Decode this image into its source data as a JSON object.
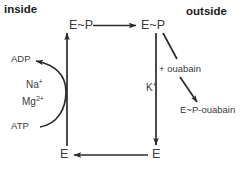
{
  "diagram": {
    "line_color": "#2b2b2b",
    "text_color": "#3a3a3a",
    "background": "#ffffff",
    "headings": {
      "inside": "inside",
      "outside": "outside"
    },
    "nodes": {
      "ep_inside": "E~P",
      "ep_outside": "E~P",
      "e_inside": "E",
      "e_outside": "E",
      "ep_ouabain": "E~P-ouabain"
    },
    "labels": {
      "adp": "ADP",
      "atp": "ATP",
      "sodium": "Na",
      "sodium_charge": "+",
      "magnesium": "Mg",
      "magnesium_charge": "2+",
      "potassium": "K",
      "potassium_charge": "+",
      "ouabain": "+ ouabain"
    },
    "edges": [
      {
        "name": "ep-inside-to-ep-outside",
        "from": "E~P (inside)",
        "to": "E~P (outside)",
        "direction": "right"
      },
      {
        "name": "ep-outside-to-e-outside",
        "from": "E~P (outside)",
        "to": "E (outside)",
        "direction": "down",
        "label": "K+"
      },
      {
        "name": "e-outside-to-e-inside",
        "from": "E (outside)",
        "to": "E (inside)",
        "direction": "left"
      },
      {
        "name": "e-inside-to-ep-inside",
        "from": "E (inside)",
        "to": "E~P (inside)",
        "direction": "up"
      },
      {
        "name": "atp-to-adp",
        "from": "ATP",
        "to": "ADP",
        "direction": "curved-up-left",
        "label": "Na+ Mg2+"
      },
      {
        "name": "ep-outside-to-ep-ouabain",
        "from": "E~P (outside)",
        "to": "E~P-ouabain",
        "direction": "diagonal-down-right",
        "label": "+ ouabain"
      }
    ]
  }
}
